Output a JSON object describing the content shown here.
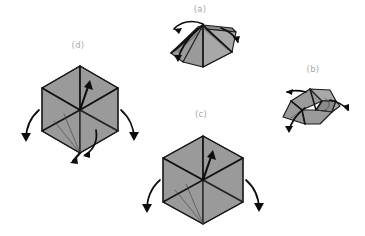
{
  "figure": {
    "background_color": "#ffffff",
    "label_color": "#a8a8a8",
    "facet_fill_color": "#9a9a9a",
    "outline_color": "#1a1a1a",
    "arrow_color": "#0d0d0d",
    "panel_count": 4
  },
  "panels": [
    {
      "id": "a",
      "label": "(a)",
      "label_x": 200,
      "label_y": 9,
      "shape": "low-pyramid-tent",
      "arrow_count": 3,
      "description": "Flattened pyramid with apex ridge, flaps opening outward"
    },
    {
      "id": "b",
      "label": "(b)",
      "label_x": 313,
      "label_y": 69,
      "shape": "opened-pyramid-shell",
      "arrow_count": 3,
      "description": "Partially opened shell with three flaps spreading"
    },
    {
      "id": "c",
      "label": "(c)",
      "label_x": 201,
      "label_y": 114,
      "shape": "hexagonal-cube-projection",
      "arrow_count": 3,
      "description": "Hexagonal cube projection with upward center arrow and two side arrows"
    },
    {
      "id": "d",
      "label": "(d)",
      "label_x": 78,
      "label_y": 45,
      "shape": "hexagonal-cube-projection",
      "arrow_count": 5,
      "description": "Hexagonal cube projection with upward center arrow, two side arrows and bottom push arrows"
    }
  ]
}
